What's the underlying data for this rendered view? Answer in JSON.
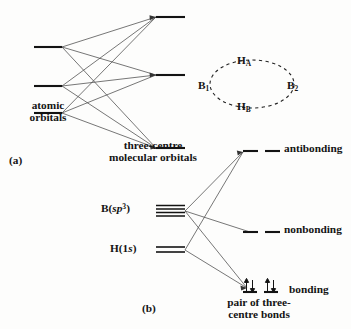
{
  "figure": {
    "panel_a": {
      "tag": "(a)",
      "left_label": "atomic\norbitals",
      "right_label": "three-centre\nmolecular orbitals",
      "left_levels": [
        {
          "name": "atomic-orbital-level-1",
          "y": 47
        },
        {
          "name": "atomic-orbital-level-2",
          "y": 86
        },
        {
          "name": "atomic-orbital-level-3",
          "y": 113
        }
      ],
      "right_levels": [
        {
          "name": "molecular-orbital-level-antibonding",
          "y": 17
        },
        {
          "name": "molecular-orbital-level-nonbonding",
          "y": 75
        },
        {
          "name": "molecular-orbital-level-bonding",
          "y": 148
        }
      ]
    },
    "cluster": {
      "caption": "",
      "atoms": [
        {
          "name": "boron-1",
          "symbol": "B",
          "subscript": "1"
        },
        {
          "name": "boron-2",
          "symbol": "B",
          "subscript": "2"
        },
        {
          "name": "hydrogen-a",
          "symbol": "H",
          "subscript": "A"
        },
        {
          "name": "hydrogen-b",
          "symbol": "H",
          "subscript": "B"
        }
      ]
    },
    "panel_b": {
      "tag": "(b)",
      "left_orbitals": [
        {
          "name": "boron-sp3-orbital",
          "element": "B",
          "open": "(",
          "italic": "sp",
          "superscript": "3",
          "close": ")",
          "lines": 4
        },
        {
          "name": "hydrogen-1s-orbital",
          "element": "H",
          "open": "(",
          "value": "1",
          "italic": "s",
          "close": ")",
          "lines": 2
        }
      ],
      "right_levels": [
        {
          "name": "antibonding-level",
          "label": "antibonding"
        },
        {
          "name": "nonbonding-level",
          "label": "nonbonding"
        },
        {
          "name": "bonding-level",
          "label": "bonding",
          "electrons": "two pairs"
        }
      ],
      "caption": "pair of three-\ncentre bonds"
    },
    "colors": {
      "ink": "#141414",
      "line": "#3a3a3a",
      "background": "#fdfdfc"
    }
  }
}
